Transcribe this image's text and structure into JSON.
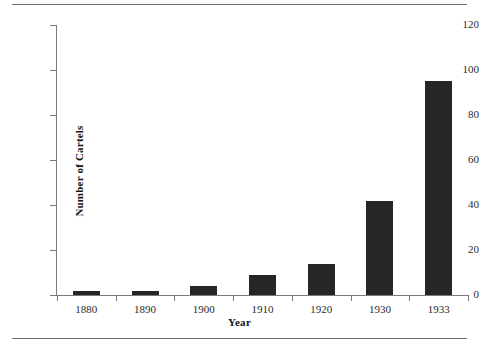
{
  "document": {
    "rules": {
      "top_rule": "horizontal-rule",
      "bottom_rule": "horizontal-rule"
    }
  },
  "chart_data": {
    "type": "bar",
    "title": "",
    "subtitle": "",
    "xlabel": "Year",
    "ylabel": "Number of Cartels",
    "categories": [
      "1880",
      "1890",
      "1900",
      "1910",
      "1920",
      "1930",
      "1933"
    ],
    "values": [
      2,
      2,
      4,
      9,
      14,
      42,
      95
    ],
    "series": [
      {
        "name": "Number of Cartels",
        "values": [
          2,
          2,
          4,
          9,
          14,
          42,
          95
        ]
      }
    ],
    "ylim": [
      0,
      120
    ],
    "ytick_labels": [
      "0",
      "20",
      "40",
      "60",
      "80",
      "100",
      "120"
    ],
    "ytick_values": [
      0,
      20,
      40,
      60,
      80,
      100,
      120
    ],
    "xtick_labels": [
      "1880",
      "1890",
      "1900",
      "1910",
      "1920",
      "1930",
      "1933"
    ],
    "grid": false,
    "legend": false,
    "legend_position": "none",
    "bar_color": "#262626",
    "axis_color": "#7a7a7a",
    "text_color": "#2b2b2b",
    "background": "#ffffff",
    "annotations": []
  }
}
